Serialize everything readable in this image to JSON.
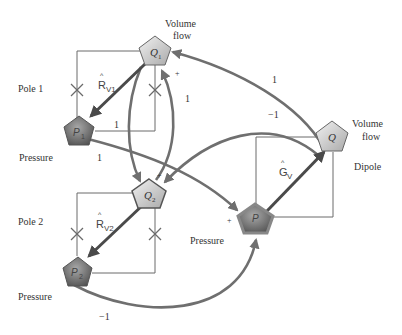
{
  "diagram": {
    "nodes": {
      "q1": {
        "label": "Q",
        "sub": "1",
        "desc_line1": "Volume",
        "desc_line2": "flow"
      },
      "p1": {
        "label": "P",
        "sub": "1",
        "desc": "Pressure"
      },
      "q2": {
        "label": "Q",
        "sub": "2"
      },
      "p2": {
        "label": "P",
        "sub": "2",
        "desc": "Pressure"
      },
      "q": {
        "label": "Q",
        "desc_line1": "Volume",
        "desc_line2": "flow"
      },
      "p": {
        "label": "P",
        "desc": "Pressure"
      }
    },
    "groups": {
      "pole1": "Pole 1",
      "pole2": "Pole 2",
      "dipole": "Dipole"
    },
    "gains": {
      "rv1": {
        "main": "R",
        "hat": "^",
        "sub": "V1"
      },
      "rv2": {
        "main": "R",
        "hat": "^",
        "sub": "V2"
      },
      "gv": {
        "main": "G",
        "hat": "^",
        "sub": "V"
      }
    },
    "edge_labels": {
      "p1_loop": "1",
      "q_to_q1": "1",
      "q2_to_q1": "1",
      "q_to_q2": "−1",
      "p1_to_p": "1",
      "p2_to_p": "−1"
    },
    "signs": {
      "q1_plus": "+",
      "q2_plus": "+",
      "p_plus": "+"
    }
  }
}
